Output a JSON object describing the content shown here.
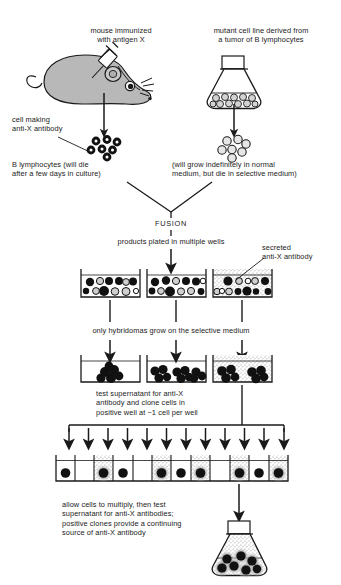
{
  "figure": {
    "title_text": "Monoclonal antibody production by hybridoma fusion",
    "ink_color": "#1a1a1a",
    "mouse_fill": "#b8b8b8",
    "stipple_color": "#9a9a9a"
  },
  "labels": {
    "mouse_caption": "mouse immunized\nwith antigen X",
    "myeloma_caption": "mutant cell line derived from\na tumor of B lymphocytes",
    "cell_making": "cell making\nanti-X antibody",
    "b_lymphocytes": "B lymphocytes (will die\nafter a few days in culture)",
    "myeloma_fate": "(will grow indefinitely in normal\nmedium, but die in selective medium)",
    "fusion": "FUSION",
    "plated": "products plated in multiple wells",
    "secreted": "secreted\nanti-X antibody",
    "selective": "only hybridomas grow on the selective medium",
    "test_supernatant": "test supernatant for anti-X\nantibody and clone cells in\npositive well at ~1 cell per well",
    "allow_multiply": "allow cells to multiply, then test\nsupernatant for anti-X antibodies;\npositive clones provide a continuing\nsource of anti-X antibody"
  },
  "diagram_data": {
    "type": "flow-diagram",
    "steps": [
      "immunize mouse with antigen X",
      "harvest B lymphocytes making anti-X antibody",
      "grow mutant myeloma cell line from B-lymphocyte tumor",
      "fusion of B lymphocytes with myeloma cells",
      "plate fusion products in multiple wells",
      "select on selective medium so only hybridomas grow",
      "test supernatant for anti-X antibody",
      "clone positive well at ~1 cell per well",
      "allow clones to multiply and retest supernatant",
      "expand positive clone as continuing antibody source"
    ],
    "b_lymphocyte_cluster_count": 7,
    "myeloma_flask_cell_count": 11,
    "myeloma_released_cell_count": 7,
    "fusion_wells": [
      {
        "index": 1,
        "stippled": false,
        "cells": 14
      },
      {
        "index": 2,
        "stippled": false,
        "cells": 14
      },
      {
        "index": 3,
        "stippled": true,
        "cells": 14
      }
    ],
    "selection_wells": [
      {
        "index": 1,
        "stippled": false,
        "colonies": 1
      },
      {
        "index": 2,
        "stippled": false,
        "colonies": 3
      },
      {
        "index": 3,
        "stippled": true,
        "colonies": 2
      }
    ],
    "cloning_wells": [
      {
        "index": 1,
        "cell": true,
        "stippled": false
      },
      {
        "index": 2,
        "cell": false,
        "stippled": false
      },
      {
        "index": 3,
        "cell": true,
        "stippled": true
      },
      {
        "index": 4,
        "cell": true,
        "stippled": false
      },
      {
        "index": 5,
        "cell": false,
        "stippled": false
      },
      {
        "index": 6,
        "cell": true,
        "stippled": true
      },
      {
        "index": 7,
        "cell": true,
        "stippled": false
      },
      {
        "index": 8,
        "cell": true,
        "stippled": true
      },
      {
        "index": 9,
        "cell": false,
        "stippled": false
      },
      {
        "index": 10,
        "cell": true,
        "stippled": true
      },
      {
        "index": 11,
        "cell": true,
        "stippled": false
      },
      {
        "index": 12,
        "cell": true,
        "stippled": true
      }
    ],
    "cloning_arrow_count": 12,
    "final_flask_cell_count": 7
  }
}
